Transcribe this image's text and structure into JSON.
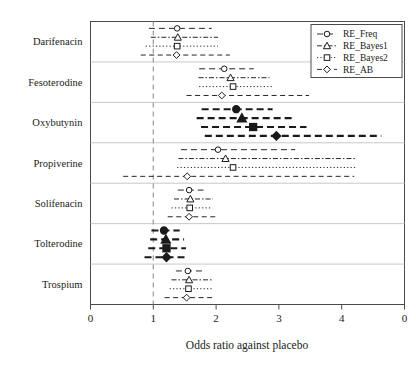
{
  "chart_data": {
    "type": "scatter",
    "title": "",
    "xlabel": "Odds ratio against placebo",
    "ylabel": "",
    "xlim": [
      0,
      5
    ],
    "xticks": [
      0,
      1,
      2,
      3,
      4,
      5
    ],
    "xtick_labels": [
      "0",
      "1",
      "2",
      "3",
      "4",
      "0"
    ],
    "reference_line": 1,
    "grid": false,
    "orientation": "horizontal-intervals",
    "legend_position": "top-right",
    "categories": [
      "Darifenacin",
      "Fesoterodine",
      "Oxybutynin",
      "Propiverine",
      "Solifenacin",
      "Tolterodine",
      "Trospium"
    ],
    "series": [
      {
        "name": "RE_Freq",
        "marker": "circle",
        "filled": false,
        "estimates": [
          1.38,
          2.13,
          2.32,
          2.03,
          1.57,
          1.17,
          1.55
        ],
        "ci_low": [
          0.93,
          1.73,
          1.77,
          1.44,
          1.39,
          0.97,
          1.36
        ],
        "ci_high": [
          1.93,
          2.6,
          2.9,
          3.26,
          1.8,
          1.42,
          1.78
        ]
      },
      {
        "name": "RE_Bayes1",
        "marker": "triangle",
        "filled": false,
        "estimates": [
          1.39,
          2.23,
          2.41,
          2.15,
          1.59,
          1.2,
          1.57
        ],
        "ci_low": [
          0.96,
          1.72,
          1.69,
          1.4,
          1.33,
          0.95,
          1.29
        ],
        "ci_high": [
          2.03,
          2.85,
          3.22,
          4.22,
          1.95,
          1.49,
          1.94
        ]
      },
      {
        "name": "RE_Bayes2",
        "marker": "square",
        "filled": false,
        "estimates": [
          1.38,
          2.27,
          2.59,
          2.27,
          1.58,
          1.21,
          1.56
        ],
        "ci_low": [
          0.88,
          1.73,
          1.76,
          1.38,
          1.29,
          0.92,
          1.26
        ],
        "ci_high": [
          2.03,
          2.89,
          3.44,
          4.23,
          1.92,
          1.52,
          1.93
        ]
      },
      {
        "name": "RE_AB",
        "marker": "diamond",
        "filled": false,
        "estimates": [
          1.37,
          2.09,
          2.96,
          1.54,
          1.57,
          1.21,
          1.53
        ],
        "ci_low": [
          0.8,
          1.53,
          1.82,
          0.52,
          1.23,
          0.86,
          1.18
        ],
        "ci_high": [
          2.22,
          3.48,
          4.63,
          4.2,
          2.0,
          1.55,
          1.99
        ]
      }
    ],
    "highlighted_categories": [
      "Oxybutynin",
      "Tolterodine"
    ],
    "highlight_note": "Markers and interval lines drawn filled/bold for these categories"
  },
  "legend": {
    "entries": [
      {
        "label": "RE_Freq",
        "marker": "circle-icon"
      },
      {
        "label": "RE_Bayes1",
        "marker": "triangle-icon"
      },
      {
        "label": "RE_Bayes2",
        "marker": "square-icon"
      },
      {
        "label": "RE_AB",
        "marker": "diamond-icon"
      }
    ]
  },
  "colors": {
    "ink": "#1a1a1a",
    "frame": "#4a4a4a",
    "separator": "#c8c8c8",
    "reference": "#9a9a9a",
    "background": "#ffffff"
  }
}
